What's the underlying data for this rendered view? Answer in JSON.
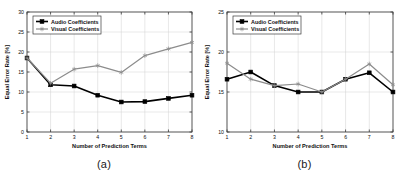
{
  "figure": {
    "panels": [
      {
        "id": "panel-a",
        "caption": "(a)",
        "chart_data": {
          "type": "line",
          "title": "",
          "xlabel": "Number of Prediction Terms",
          "ylabel": "Equal Error Rate [%]",
          "x": [
            1,
            2,
            3,
            4,
            5,
            6,
            7,
            8
          ],
          "xtick_labels": [
            "1",
            "2",
            "3",
            "4",
            "5",
            "6",
            "7",
            "8"
          ],
          "ytick_labels": [
            "0",
            "5",
            "10",
            "15",
            "20",
            "25",
            "30"
          ],
          "xlim": [
            1,
            8
          ],
          "ylim": [
            0,
            30
          ],
          "grid": true,
          "legend_position": "top-left",
          "series": [
            {
              "name": "Audio Coefficients",
              "color": "#000000",
              "marker": "filled-square",
              "values": [
                18.5,
                11.8,
                11.5,
                9.2,
                7.5,
                7.6,
                8.4,
                9.2
              ]
            },
            {
              "name": "Visual Coefficients",
              "color": "#8c8c8c",
              "marker": "star",
              "values": [
                18.5,
                12.2,
                15.7,
                16.6,
                14.9,
                19.1,
                20.8,
                22.4
              ]
            }
          ]
        }
      },
      {
        "id": "panel-b",
        "caption": "(b)",
        "chart_data": {
          "type": "line",
          "title": "",
          "xlabel": "Number of Prediction Terms",
          "ylabel": "Equal Error Rate [%]",
          "x": [
            1,
            2,
            3,
            4,
            5,
            6,
            7,
            8
          ],
          "xtick_labels": [
            "1",
            "2",
            "3",
            "4",
            "5",
            "6",
            "7",
            "8"
          ],
          "ytick_labels": [
            "10",
            "15",
            "20",
            "25"
          ],
          "xlim": [
            1,
            8
          ],
          "ylim": [
            10,
            25
          ],
          "grid": true,
          "legend_position": "top-left",
          "series": [
            {
              "name": "Audio Coefficients",
              "color": "#000000",
              "marker": "filled-square",
              "values": [
                16.6,
                17.5,
                15.8,
                15.0,
                15.0,
                16.6,
                17.4,
                15.0
              ]
            },
            {
              "name": "Visual Coefficients",
              "color": "#8c8c8c",
              "marker": "star",
              "values": [
                18.6,
                16.6,
                15.8,
                16.0,
                15.0,
                16.6,
                18.5,
                15.9
              ]
            }
          ]
        }
      }
    ]
  },
  "colors": {
    "audio": "#000000",
    "visual": "#8c8c8c",
    "grid": "#d0d0d0",
    "axis": "#3a3a3a",
    "background": "#ffffff"
  }
}
